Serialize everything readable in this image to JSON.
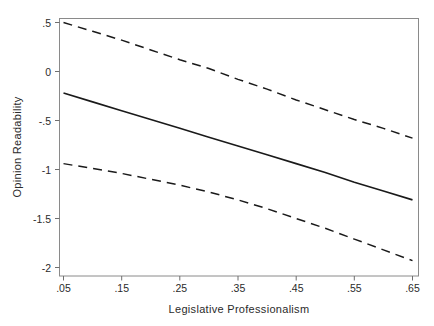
{
  "chart_data": {
    "type": "line",
    "title": "",
    "subtitle": "",
    "xlabel": "Legislative Professionalism",
    "ylabel": "Opinion Readability",
    "xlim": [
      0.02,
      0.68
    ],
    "ylim": [
      -2.09,
      0.6
    ],
    "xticks": [
      0.05,
      0.15,
      0.25,
      0.35,
      0.45,
      0.55,
      0.65
    ],
    "xtick_labels": [
      ".05",
      ".15",
      ".25",
      ".35",
      ".45",
      ".55",
      ".65"
    ],
    "yticks": [
      0.5,
      0,
      -0.5,
      -1,
      -1.5,
      -2
    ],
    "ytick_labels": [
      ".5",
      "0",
      "-.5",
      "-1",
      "-1.5",
      "-2"
    ],
    "grid": false,
    "legend": "none",
    "frame": "box",
    "x": [
      0.05,
      0.1,
      0.15,
      0.2,
      0.25,
      0.3,
      0.35,
      0.4,
      0.45,
      0.5,
      0.55,
      0.6,
      0.65
    ],
    "series": [
      {
        "name": "Upper 95% confidence bound",
        "style": "dashed",
        "color": "#1a1a1a",
        "values": [
          0.5,
          0.41,
          0.32,
          0.22,
          0.12,
          0.03,
          -0.08,
          -0.18,
          -0.29,
          -0.39,
          -0.49,
          -0.58,
          -0.68
        ]
      },
      {
        "name": "Predicted opinion readability",
        "style": "solid",
        "color": "#1a1a1a",
        "values": [
          -0.22,
          -0.31,
          -0.4,
          -0.49,
          -0.58,
          -0.67,
          -0.76,
          -0.85,
          -0.94,
          -1.03,
          -1.13,
          -1.22,
          -1.31
        ]
      },
      {
        "name": "Lower 95% confidence bound",
        "style": "dashed",
        "color": "#1a1a1a",
        "values": [
          -0.94,
          -0.99,
          -1.04,
          -1.1,
          -1.16,
          -1.23,
          -1.31,
          -1.4,
          -1.5,
          -1.6,
          -1.71,
          -1.82,
          -1.93
        ]
      }
    ]
  },
  "axes": {
    "x_axis_title": "Legislative Professionalism",
    "y_axis_title": "Opinion Readability"
  },
  "style": {
    "line_color": "#1a1a1a",
    "frame_color": "#7a7a7a",
    "background": "#ffffff"
  }
}
